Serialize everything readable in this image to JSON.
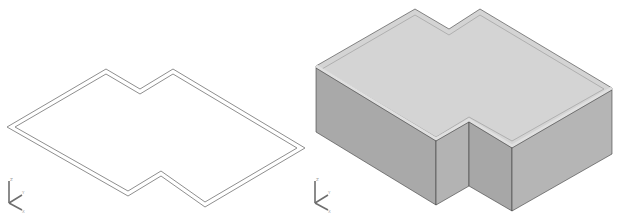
{
  "figure": {
    "panels": [
      {
        "id": "plan",
        "kind": "2d-floorplan-outline",
        "line_color": "#8f8f8f",
        "outer": [
          [
            7,
            127
          ],
          [
            106,
            69
          ],
          [
            140,
            89
          ],
          [
            173,
            69
          ],
          [
            305,
            148
          ],
          [
            205,
            207
          ],
          [
            161,
            176
          ],
          [
            128,
            196
          ]
        ],
        "inner": [
          [
            15,
            127
          ],
          [
            106,
            74
          ],
          [
            140,
            94
          ],
          [
            173,
            74
          ],
          [
            297,
            148
          ],
          [
            205,
            202
          ],
          [
            161,
            171
          ],
          [
            128,
            191
          ]
        ],
        "ucs": {
          "origin": [
            9,
            203
          ],
          "z_label": "Z",
          "y_label": "Y",
          "x_label": "X"
        }
      },
      {
        "id": "model",
        "kind": "3d-extruded-walls",
        "colors": {
          "wall_front": "#a9a9a9",
          "wall_side": "#b4b4b4",
          "wall_inner": "#a4a4a4",
          "rim": "#d4d4d4",
          "edge": "#3c3c3c",
          "hole": "#ffffff"
        },
        "wall_height": 66,
        "ucs": {
          "origin": [
            10,
            203
          ],
          "z_label": "Z",
          "y_label": "Y",
          "x_label": "X"
        }
      }
    ]
  }
}
